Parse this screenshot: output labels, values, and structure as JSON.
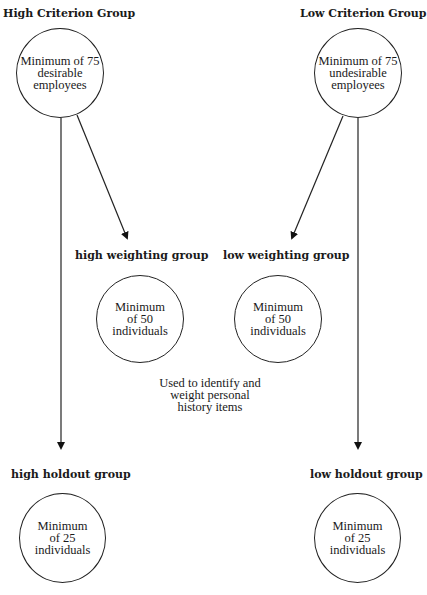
{
  "diagram": {
    "top_left": {
      "title": "High Criterion Group",
      "circle_lines": [
        "Minimum of 75",
        "desirable",
        "employees"
      ]
    },
    "top_right": {
      "title": "Low Criterion Group",
      "circle_lines": [
        "Minimum of 75",
        "undesirable",
        "employees"
      ]
    },
    "middle_left": {
      "title": "high weighting group",
      "circle_lines": [
        "Minimum",
        "of 50",
        "individuals"
      ]
    },
    "middle_right": {
      "title": "low weighting group",
      "circle_lines": [
        "Minimum",
        "of 50",
        "individuals"
      ]
    },
    "middle_note": {
      "lines": [
        "Used to identify and",
        "weight personal",
        "history items"
      ]
    },
    "bottom_left": {
      "title": "high holdout group",
      "circle_lines": [
        "Minimum",
        "of 25",
        "individuals"
      ]
    },
    "bottom_right": {
      "title": "low holdout group",
      "circle_lines": [
        "Minimum",
        "of 25",
        "individuals"
      ]
    }
  }
}
